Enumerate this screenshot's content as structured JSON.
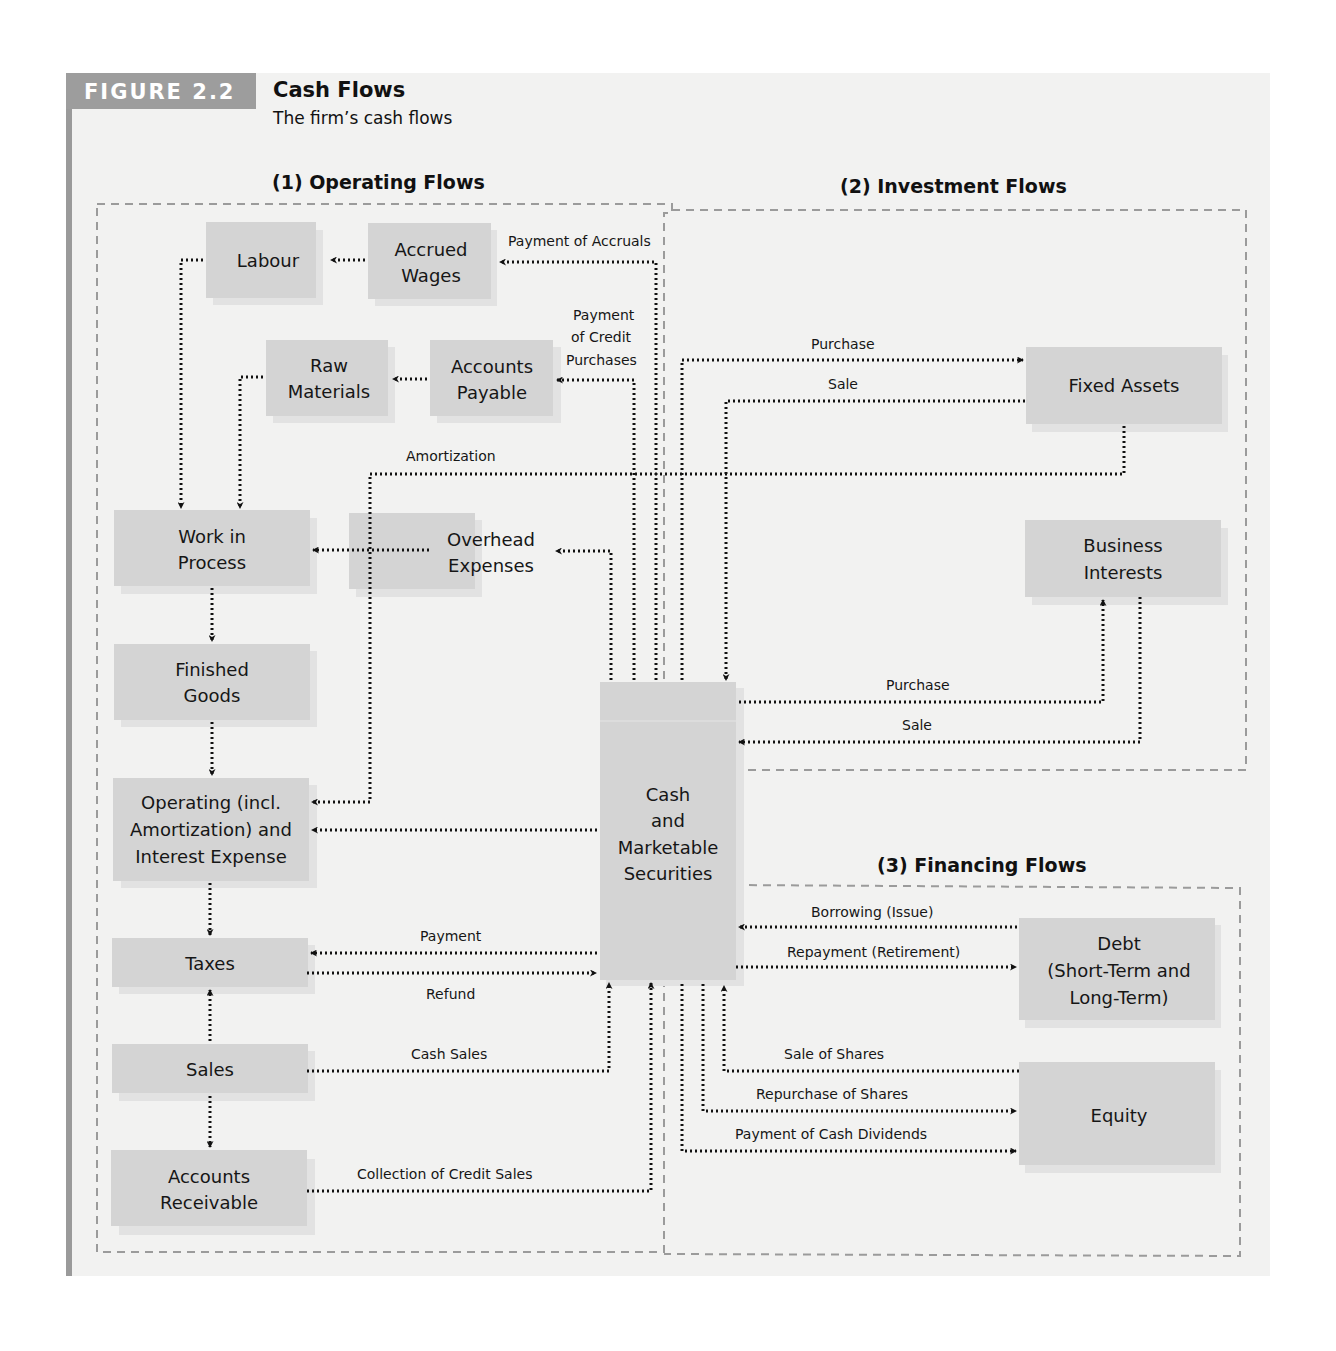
{
  "figure": {
    "tag": "FIGURE 2.2",
    "title": "Cash Flows",
    "subtitle": "The firm’s cash flows"
  },
  "sections": {
    "operating": "(1) Operating Flows",
    "investment": "(2) Investment Flows",
    "financing": "(3) Financing Flows"
  },
  "nodes": {
    "labour": [
      "Labour"
    ],
    "accrued_wages": [
      "Accrued",
      "Wages"
    ],
    "raw_materials": [
      "Raw",
      "Materials"
    ],
    "accounts_payable": [
      "Accounts",
      "Payable"
    ],
    "work_in_process": [
      "Work in",
      "Process"
    ],
    "overhead_expenses": [
      "Overhead",
      "Expenses"
    ],
    "finished_goods": [
      "Finished",
      "Goods"
    ],
    "operating_expense": [
      "Operating (incl.",
      "Amortization) and",
      "Interest Expense"
    ],
    "taxes": [
      "Taxes"
    ],
    "sales": [
      "Sales"
    ],
    "accounts_receivable": [
      "Accounts",
      "Receivable"
    ],
    "cash": [
      "Cash",
      "and",
      "Marketable",
      "Securities"
    ],
    "fixed_assets": [
      "Fixed Assets"
    ],
    "business_interests": [
      "Business",
      "Interests"
    ],
    "debt": [
      "Debt",
      "(Short-Term and",
      "Long-Term)"
    ],
    "equity": [
      "Equity"
    ]
  },
  "flow_labels": {
    "payment_of_accruals": "Payment of Accruals",
    "payment_credit_purchases": [
      "Payment",
      "of Credit",
      "Purchases"
    ],
    "amortization": "Amortization",
    "fa_purchase": "Purchase",
    "fa_sale": "Sale",
    "bi_purchase": "Purchase",
    "bi_sale": "Sale",
    "tax_payment": "Payment",
    "tax_refund": "Refund",
    "cash_sales": "Cash Sales",
    "collection_credit_sales": "Collection of Credit Sales",
    "borrowing": "Borrowing (Issue)",
    "repayment": "Repayment (Retirement)",
    "sale_of_shares": "Sale of Shares",
    "repurchase_of_shares": "Repurchase of Shares",
    "payment_cash_dividends": "Payment of Cash Dividends"
  },
  "colors": {
    "box_fill": "#d4d4d4",
    "panel_bg": "#f2f2f1",
    "tag_bg": "#9d9d9d",
    "region_border": "#9b9b9b",
    "flow_line": "#111111"
  }
}
